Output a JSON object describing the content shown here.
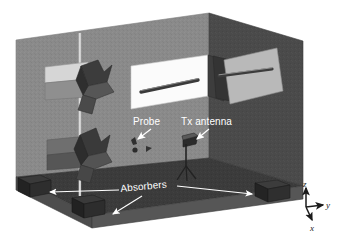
{
  "figure": {
    "type": "technical-diagram"
  },
  "labels": {
    "probe": "Probe",
    "tx_antenna": "Tx antenna",
    "absorbers": "Absorbers"
  },
  "axes": {
    "z": "z",
    "y": "y",
    "x": "x"
  },
  "colors": {
    "back_wall": "#8a8a8a",
    "right_wall": "#4a4a4a",
    "floor": "#3b3b3b",
    "floor_edge": "#565656",
    "panel_white": "#fbfbfb",
    "panel_light": "#d0d0d0",
    "panel_mid": "#a8a8a8",
    "panel_dark": "#6d6d6d",
    "absorber_box": "#2e2e2e",
    "label_text": "#ffffff",
    "axis_text": "#1b1b1b",
    "arrow": "#ffffff",
    "pole": "#c9c9c9"
  },
  "objects": {
    "reflectarray_panels": 2,
    "absorber_boxes": 3,
    "slot_panels": 2,
    "mast": 1,
    "tripod": 1
  }
}
